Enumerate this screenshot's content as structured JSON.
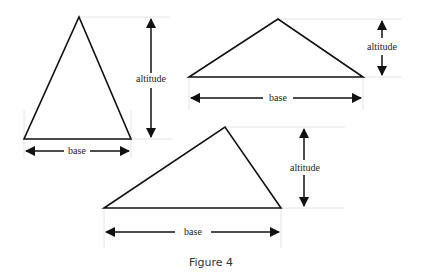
{
  "figure": {
    "caption": "Figure 4",
    "triangles": [
      {
        "id": "acute-tall",
        "base_label": "base",
        "altitude_label": "altitude",
        "vertices": {
          "left": [
            24,
            139
          ],
          "right": [
            131,
            139
          ],
          "apex": [
            79,
            17
          ]
        },
        "altitude_arrow": {
          "x": 151,
          "y1": 17,
          "y2": 139,
          "label_y": 81
        },
        "base_arrow": {
          "y": 151,
          "x1": 24,
          "x2": 131,
          "label_x": 77
        }
      },
      {
        "id": "obtuse-flat",
        "base_label": "base",
        "altitude_label": "altitude",
        "vertices": {
          "left": [
            189,
            77
          ],
          "right": [
            363,
            77
          ],
          "apex": [
            278,
            19
          ]
        },
        "altitude_arrow": {
          "x": 382,
          "y1": 19,
          "y2": 77,
          "label_y": 48
        },
        "base_arrow": {
          "y": 98,
          "x1": 189,
          "x2": 363,
          "label_x": 278
        }
      },
      {
        "id": "scalene",
        "base_label": "base",
        "altitude_label": "altitude",
        "vertices": {
          "left": [
            104,
            208
          ],
          "right": [
            281,
            208
          ],
          "apex": [
            225,
            127
          ]
        },
        "altitude_arrow": {
          "x": 304,
          "y1": 127,
          "y2": 208,
          "label_y": 168
        },
        "base_arrow": {
          "y": 232,
          "x1": 104,
          "x2": 281,
          "label_x": 195
        }
      }
    ]
  }
}
